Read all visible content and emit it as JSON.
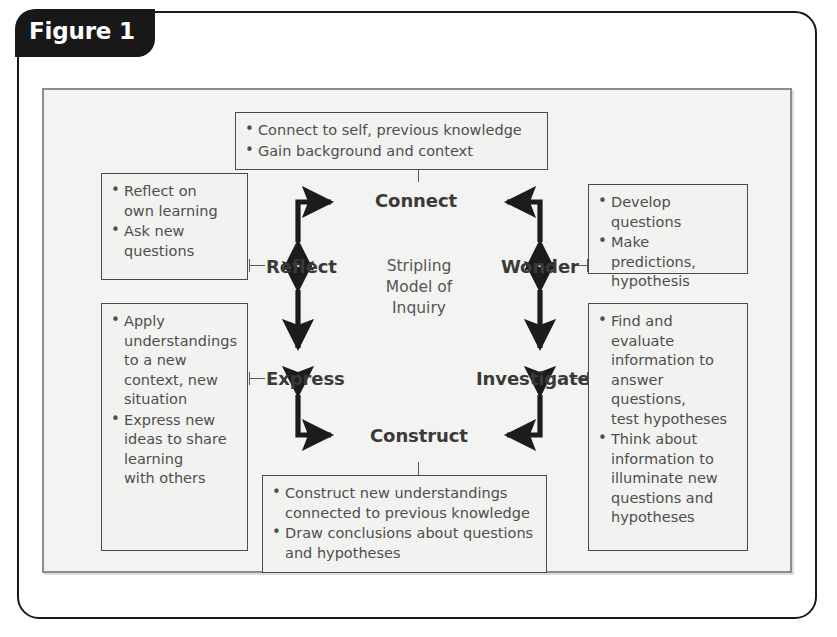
{
  "figure": {
    "tab_label": "Figure 1",
    "center_label": "Stripling\nModel of\nInquiry"
  },
  "nodes": {
    "connect": "Connect",
    "reflect": "Reflect",
    "wonder": "Wonder",
    "express": "Express",
    "investigate": "Investigate",
    "construct": "Construct"
  },
  "boxes": {
    "connect": {
      "items": [
        "Connect to self, previous knowledge",
        "Gain background and context"
      ]
    },
    "reflect": {
      "items": [
        "Reflect on\nown learning",
        "Ask new\nquestions"
      ]
    },
    "wonder": {
      "items": [
        "Develop questions",
        "Make predictions,\nhypothesis"
      ]
    },
    "express": {
      "items": [
        "Apply\nunderstandings\nto a new\ncontext, new\nsituation",
        "Express new\nideas to share\nlearning\nwith others"
      ]
    },
    "investigate": {
      "items": [
        "Find and evaluate\ninformation to\nanswer questions,\ntest hypotheses",
        "Think about\ninformation to\nilluminate new\nquestions and\nhypotheses"
      ]
    },
    "construct": {
      "items": [
        "Construct new understandings\nconnected to previous knowledge",
        "Draw conclusions about questions\nand hypotheses"
      ]
    }
  },
  "colors": {
    "frame": "#1a1a1a",
    "tab_bg": "#181818",
    "panel_bg": "#f3f3f1",
    "panel_border": "#8d8d8d",
    "box_border": "#4a4a4a",
    "text": "#4e4e4e",
    "node_text": "#3a3a3a",
    "arrow": "#1c1c1c"
  }
}
